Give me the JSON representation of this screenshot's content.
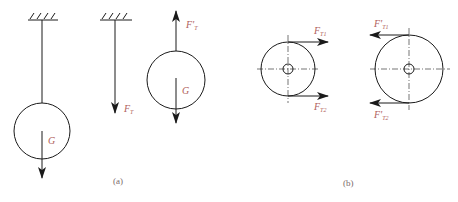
{
  "colors": {
    "line": "#1a1a1a",
    "label": "#b0605a",
    "caption": "#7a6a6a"
  },
  "figure_a": {
    "caption": "(a)",
    "hanging_ball": {
      "weight_label": "G"
    },
    "rope": {
      "force_label_main": "F",
      "force_label_sub": "T"
    },
    "free_body_ball": {
      "tension_label_main": "F'",
      "tension_label_sub": "T",
      "weight_label": "G"
    }
  },
  "figure_b": {
    "caption": "(b)",
    "left_pulley": {
      "top_force_main": "F",
      "top_force_sub": "T1",
      "bottom_force_main": "F",
      "bottom_force_sub": "T2"
    },
    "right_pulley": {
      "top_force_main": "F'",
      "top_force_sub": "T1",
      "bottom_force_main": "F'",
      "bottom_force_sub": "T2"
    }
  }
}
